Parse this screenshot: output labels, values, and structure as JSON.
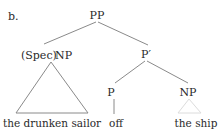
{
  "diagram": {
    "type": "syntax-tree",
    "example_label": "b.",
    "nodes": {
      "root": {
        "label": "PP"
      },
      "spec_np": {
        "spec": "(Spec)",
        "label": "NP"
      },
      "p_bar": {
        "label": "P′"
      },
      "p": {
        "label": "P"
      },
      "obj_np": {
        "label": "NP"
      }
    },
    "leaves": {
      "spec_np": "the drunken sailor",
      "p": "off",
      "obj_np": "the ship"
    },
    "edges": [
      [
        "PP",
        "(Spec) NP"
      ],
      [
        "PP",
        "P′"
      ],
      [
        "P′",
        "P"
      ],
      [
        "P′",
        "NP"
      ],
      [
        "P",
        "off"
      ]
    ],
    "triangles": [
      {
        "node": "(Spec) NP",
        "covers": "the drunken sailor",
        "style": "solid"
      },
      {
        "node": "NP",
        "covers": "the ship",
        "style": "faint"
      }
    ],
    "colors": {
      "text": "#2a2a2a",
      "edge": "#8a8a8a",
      "faint_triangle": "#dcdcdc"
    }
  }
}
